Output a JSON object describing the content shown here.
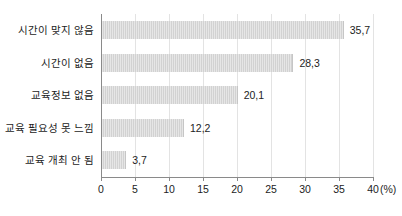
{
  "chart_data": {
    "type": "bar",
    "orientation": "horizontal",
    "title": "",
    "xlabel": "",
    "ylabel": "",
    "unit_label": "(%)",
    "categories": [
      "시간이 맞지 않음",
      "시간이 없음",
      "교육정보 없음",
      "교육 필요성 못 느낌",
      "교육 개최 안 됨"
    ],
    "values": [
      35.7,
      28.3,
      20.1,
      12.2,
      3.7
    ],
    "value_labels": [
      "35,7",
      "28,3",
      "20,1",
      "12,2",
      "3,7"
    ],
    "xlim": [
      0,
      40
    ],
    "xticks": [
      0,
      5,
      10,
      15,
      20,
      25,
      30,
      35,
      40
    ],
    "xtick_labels": [
      "0",
      "5",
      "10",
      "15",
      "20",
      "25",
      "30",
      "35",
      "40"
    ],
    "grid": "vertical",
    "legend": "none",
    "bar_color": "#d2d2d2",
    "axis_color": "#8a8a8a",
    "grid_color": "#e3e3e3",
    "text_color": "#1c1c1c",
    "background_color": "#ffffff"
  }
}
